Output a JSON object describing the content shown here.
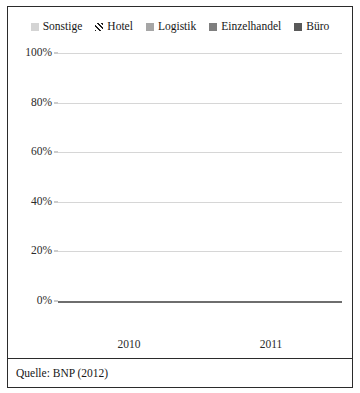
{
  "chart_data": {
    "type": "bar",
    "stacked": true,
    "normalized_percent": true,
    "title": "",
    "subtitle": "",
    "xlabel": "",
    "ylabel": "",
    "categories": [
      "2010",
      "2011"
    ],
    "ylim": [
      0,
      100
    ],
    "yticks": [
      "0%",
      "20%",
      "40%",
      "60%",
      "80%",
      "100%"
    ],
    "ytick_values": [
      0,
      20,
      40,
      60,
      80,
      100
    ],
    "grid": true,
    "legend_position": "top",
    "series": [
      {
        "name": "Büro",
        "values": [
          37,
          30
        ],
        "color": "#595959",
        "pattern": "solid"
      },
      {
        "name": "Einzelhandel",
        "values": [
          40,
          46
        ],
        "color": "#7f7f7f",
        "pattern": "solid"
      },
      {
        "name": "Logistik",
        "values": [
          5,
          5
        ],
        "color": "#a6a6a6",
        "pattern": "solid"
      },
      {
        "name": "Hotel",
        "values": [
          4,
          3
        ],
        "color": "#ffffff",
        "pattern": "diagonal-hatch"
      },
      {
        "name": "Sonstige",
        "values": [
          14,
          16
        ],
        "color": "#d4d4d4",
        "pattern": "solid"
      }
    ],
    "legend_order": [
      "Sonstige",
      "Hotel",
      "Logistik",
      "Einzelhandel",
      "Büro"
    ],
    "caption": "Quelle: BNP (2012)"
  },
  "legend": {
    "items": [
      {
        "label": "Sonstige",
        "swatch": "legend-swatch-sonstige"
      },
      {
        "label": "Hotel",
        "swatch": "legend-swatch-hotel"
      },
      {
        "label": "Logistik",
        "swatch": "legend-swatch-logistik"
      },
      {
        "label": "Einzelhandel",
        "swatch": "legend-swatch-einzelhandel"
      },
      {
        "label": "Büro",
        "swatch": "legend-swatch-buero"
      }
    ]
  },
  "caption": {
    "text": "Quelle: BNP (2012)"
  },
  "colors": {
    "frame": "#2b2b2b",
    "gridline": "#d6d6d6",
    "baseline": "#6e6e6e",
    "sonstige": "#d4d4d4",
    "logistik": "#a6a6a6",
    "einzelhandel": "#7f7f7f",
    "buero": "#595959",
    "hotel_stripe_dark": "#1f1f1f",
    "hotel_stripe_light": "#ffffff"
  }
}
